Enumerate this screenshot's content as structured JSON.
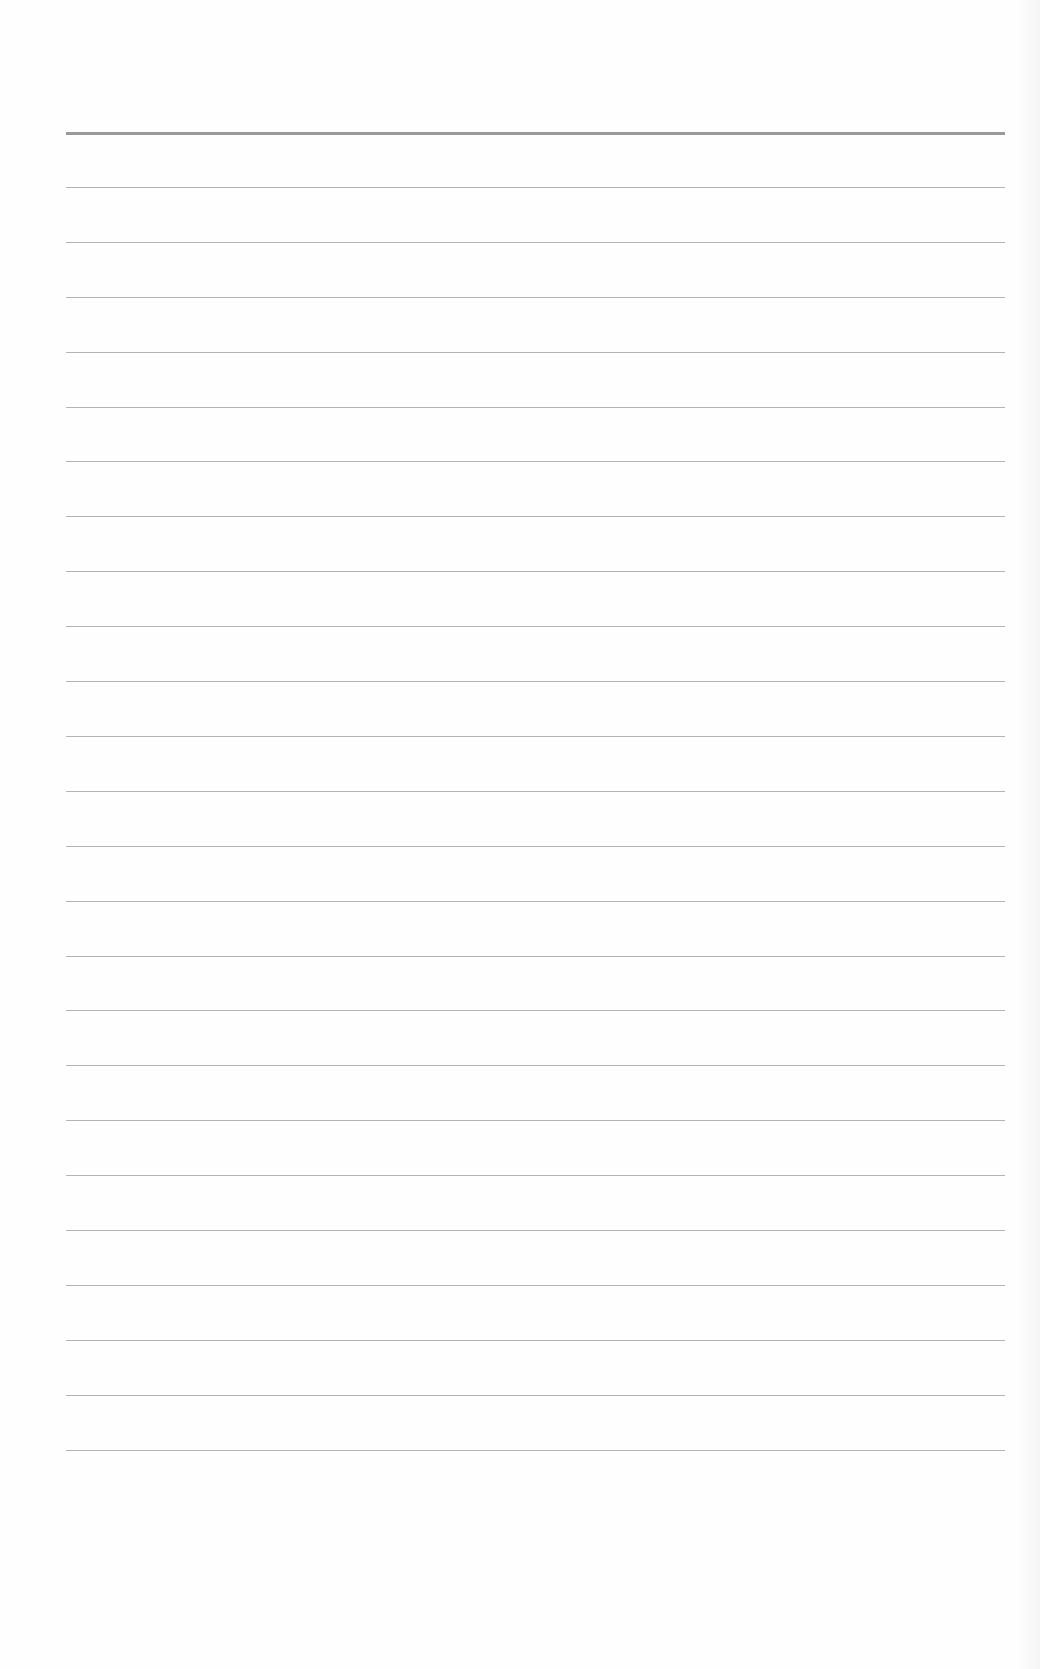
{
  "page": {
    "type": "lined-paper",
    "background_color": "#fefefe",
    "line_color": "#b4b4b4",
    "header_line_color": "#9a9a9a",
    "line_left": 66,
    "line_width": 939,
    "first_line_top": 132,
    "line_spacing": 54.9,
    "line_count": 25
  }
}
